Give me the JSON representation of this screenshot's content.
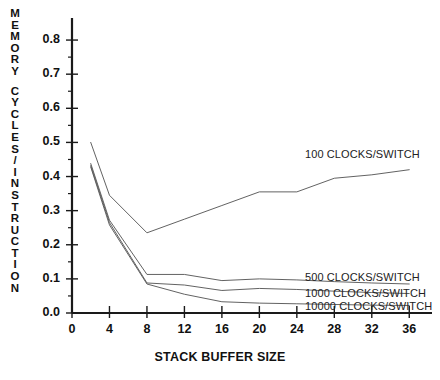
{
  "chart_data": {
    "type": "line",
    "title": "",
    "xlabel": "STACK BUFFER SIZE",
    "ylabel": "MEMORY CYCLES/INSTRUCTION",
    "xlim": [
      0,
      38
    ],
    "ylim": [
      0.0,
      0.85
    ],
    "grid": false,
    "legend_position": "inline-right",
    "xticks": [
      "0",
      "4",
      "8",
      "12",
      "16",
      "20",
      "24",
      "28",
      "32",
      "36"
    ],
    "xtick_values": [
      0,
      4,
      8,
      12,
      16,
      20,
      24,
      28,
      32,
      36
    ],
    "yticks": [
      "0.0",
      "0.1",
      "0.2",
      "0.3",
      "0.4",
      "0.5",
      "0.6",
      "0.7",
      "0.8"
    ],
    "ytick_values": [
      0.0,
      0.1,
      0.2,
      0.3,
      0.4,
      0.5,
      0.6,
      0.7,
      0.8
    ],
    "line_color": "#5a5a5a",
    "axis_color": "#1a1a1a",
    "series": [
      {
        "name": "100 CLOCKS/SWITCH",
        "label": "100 CLOCKS/SWITCH",
        "x": [
          2,
          4,
          8,
          12,
          16,
          20,
          24,
          28,
          32,
          36
        ],
        "values": [
          0.5,
          0.345,
          0.235,
          0.275,
          0.315,
          0.355,
          0.355,
          0.395,
          0.405,
          0.42
        ]
      },
      {
        "name": "500 CLOCKS/SWITCH",
        "label": "500 CLOCKS/SWITCH",
        "x": [
          2,
          4,
          8,
          12,
          16,
          20,
          24,
          28,
          32,
          36
        ],
        "values": [
          0.438,
          0.272,
          0.113,
          0.113,
          0.095,
          0.1,
          0.097,
          0.092,
          0.088,
          0.085
        ]
      },
      {
        "name": "1000 CLOCKS/SWITCH",
        "label": "1000 CLOCKS/SWITCH",
        "x": [
          2,
          4,
          8,
          12,
          16,
          20,
          24,
          28,
          32,
          36
        ],
        "values": [
          0.432,
          0.265,
          0.088,
          0.082,
          0.066,
          0.072,
          0.069,
          0.064,
          0.06,
          0.057
        ]
      },
      {
        "name": "10000 CLOCKS/SWITCH",
        "label": "10000 CLOCKS/SWITCH",
        "x": [
          2,
          4,
          8,
          12,
          16,
          20,
          24,
          28,
          32,
          36
        ],
        "values": [
          0.428,
          0.258,
          0.085,
          0.055,
          0.033,
          0.029,
          0.027,
          0.025,
          0.023,
          0.022
        ]
      }
    ],
    "ylabel_letters": [
      "M",
      "E",
      "M",
      "O",
      "R",
      "Y",
      "",
      "C",
      "Y",
      "C",
      "L",
      "E",
      "S",
      "/",
      "I",
      "N",
      "S",
      "T",
      "R",
      "U",
      "C",
      "T",
      "I",
      "O",
      "N"
    ]
  }
}
